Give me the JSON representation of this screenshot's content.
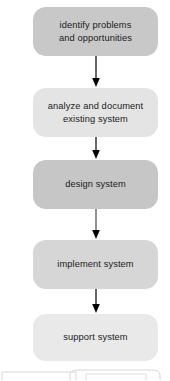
{
  "diagram": {
    "type": "flowchart",
    "orientation": "vertical-top-to-bottom",
    "title": "",
    "nodes": [
      {
        "id": "node-1",
        "label": "identify problems\nand opportunities",
        "shape": "rounded-rectangle",
        "fill": "#c8c8c8"
      },
      {
        "id": "node-2",
        "label": "analyze and document\nexisting system",
        "shape": "rounded-rectangle",
        "fill": "#e4e4e4"
      },
      {
        "id": "node-3",
        "label": "design system",
        "shape": "rounded-rectangle",
        "fill": "#c6c6c6"
      },
      {
        "id": "node-4",
        "label": "implement system",
        "shape": "rounded-rectangle",
        "fill": "#d6d6d6"
      },
      {
        "id": "node-5",
        "label": "support system",
        "shape": "rounded-rectangle",
        "fill": "#e9e9e9"
      }
    ],
    "connectors": [
      {
        "id": "arrow-1",
        "from": "node-1",
        "to": "node-2",
        "style": "solid-arrow-down",
        "color": "#000000"
      },
      {
        "id": "arrow-2",
        "from": "node-2",
        "to": "node-3",
        "style": "solid-arrow-down",
        "color": "#000000"
      },
      {
        "id": "arrow-3",
        "from": "node-3",
        "to": "node-4",
        "style": "solid-arrow-down",
        "color": "#555555"
      },
      {
        "id": "arrow-4",
        "from": "node-4",
        "to": "node-5",
        "style": "solid-arrow-down",
        "color": "#000000"
      }
    ],
    "cutoff_shapes": {
      "description": "partially visible outlines at bottom edge",
      "outline_color": "#d8d8d8"
    },
    "colors": {
      "background": "#ffffff",
      "text": "#1b1b1b",
      "arrow": "#000000"
    }
  }
}
